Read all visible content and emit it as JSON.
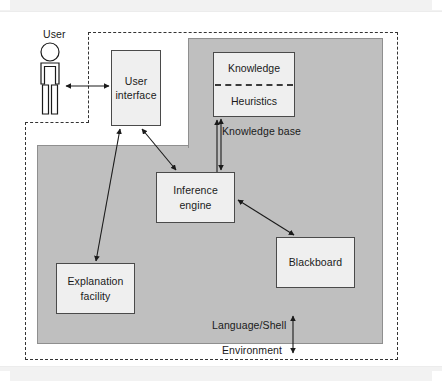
{
  "diagram": {
    "type": "block-diagram",
    "colors": {
      "shell_fill": "#bfbfbf",
      "shell_stroke": "#8f8f8f",
      "node_fill": "#efefef",
      "node_stroke": "#4a4a4a",
      "dashed_stroke": "#333333",
      "text": "#1a1a1a",
      "page_band": "#f2f2f2"
    },
    "actors": {
      "user_label": "User"
    },
    "nodes": [
      {
        "id": "user-interface",
        "label_line1": "User",
        "label_line2": "interface"
      },
      {
        "id": "knowledge-base",
        "label_line1": "Knowledge",
        "label_line2": "Heuristics"
      },
      {
        "id": "inference-engine",
        "label_line1": "Inference",
        "label_line2": "engine"
      },
      {
        "id": "blackboard",
        "label_line1": "Blackboard",
        "label_line2": ""
      },
      {
        "id": "explanation-facility",
        "label_line1": "Explanation",
        "label_line2": "facility"
      }
    ],
    "captions": {
      "knowledge_base": "Knowledge base",
      "language_shell": "Language/Shell",
      "environment": "Environment"
    },
    "connections": [
      {
        "from": "user",
        "to": "user-interface",
        "arrow": "double"
      },
      {
        "from": "user-interface",
        "to": "inference-engine",
        "arrow": "double"
      },
      {
        "from": "user-interface",
        "to": "explanation-facility",
        "arrow": "double"
      },
      {
        "from": "knowledge-base",
        "to": "inference-engine",
        "arrow": "double"
      },
      {
        "from": "inference-engine",
        "to": "blackboard",
        "arrow": "double"
      },
      {
        "from": "knowledge-base-caption",
        "to": "knowledge-base",
        "arrow": "single"
      },
      {
        "from": "environment-caption",
        "to": "language-shell",
        "arrow": "double"
      }
    ]
  }
}
